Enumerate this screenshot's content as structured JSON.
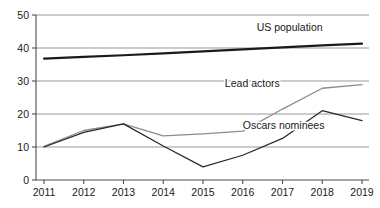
{
  "chart_data": {
    "type": "line",
    "title": "",
    "subtitle": "",
    "xlabel": "",
    "ylabel": "",
    "categories": [
      "2011",
      "2012",
      "2013",
      "2014",
      "2015",
      "2016",
      "2017",
      "2018",
      "2019"
    ],
    "x": [
      2011,
      2012,
      2013,
      2014,
      2015,
      2016,
      2017,
      2018,
      2019
    ],
    "xlim": [
      2011,
      2019
    ],
    "ylim": [
      0,
      50
    ],
    "yticks": [
      0,
      10,
      20,
      30,
      40,
      50
    ],
    "ytick_labels": [
      "0",
      "10",
      "20",
      "30",
      "40",
      "50"
    ],
    "xtick_labels": [
      "2011",
      "2012",
      "2013",
      "2014",
      "2015",
      "2016",
      "2017",
      "2018",
      "2019"
    ],
    "grid": true,
    "grid_axis": "y",
    "legend": "inline-labels",
    "series": [
      {
        "name": "US population",
        "color": "#1a1a1a",
        "width": 2.2,
        "values": [
          36.8,
          37.3,
          37.8,
          38.4,
          39.0,
          39.6,
          40.2,
          40.8,
          41.3
        ],
        "label_x": 2016.35,
        "label_y": 45.2
      },
      {
        "name": "Lead actors",
        "color": "#8c8c8c",
        "width": 1.3,
        "values": [
          10.2,
          15.0,
          17.0,
          13.4,
          14.0,
          14.8,
          21.5,
          27.8,
          28.9
        ],
        "label_x": 2015.55,
        "label_y": 28.2
      },
      {
        "name": "Oscars nominees",
        "color": "#2a2a2a",
        "width": 1.3,
        "values": [
          10.0,
          14.4,
          17.0,
          10.3,
          4.0,
          7.5,
          12.6,
          21.0,
          18.0
        ],
        "label_x": 2016.0,
        "label_y": 15.6
      }
    ],
    "axis_color": "#4d4d4d",
    "grid_color": "#8c8c8c",
    "background": "#ffffff"
  }
}
